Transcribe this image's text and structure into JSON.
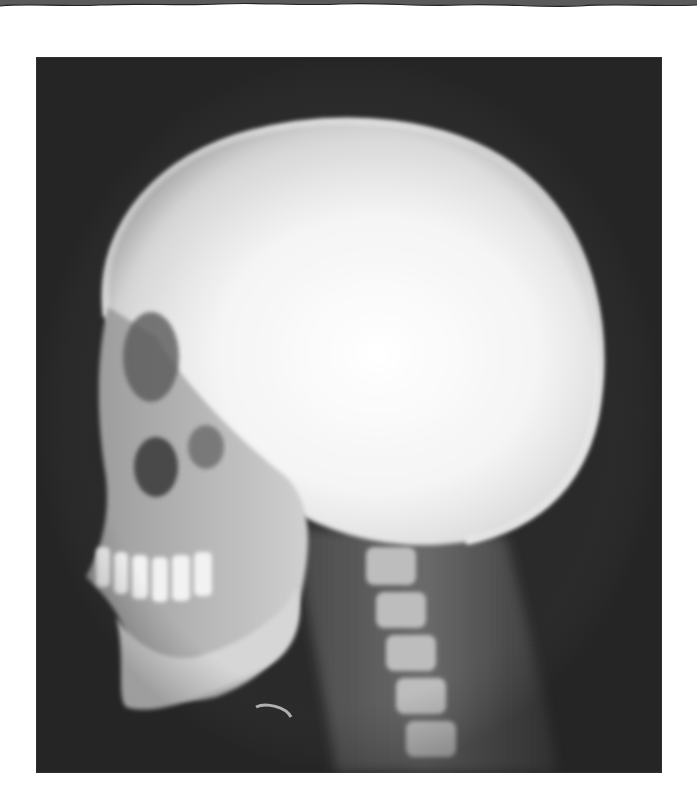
{
  "image": {
    "subject": "Lateral skull radiograph (X-ray) showing cranium, facial bones, teeth, mandible and cervical spine",
    "view": "lateral, facing left",
    "colors": {
      "page_background": "#ffffff",
      "film_background": "#2a2a2a",
      "bone_highlight": "#ffffff",
      "soft_tissue": "#5a5a5a",
      "torn_edge": "#555555"
    }
  }
}
